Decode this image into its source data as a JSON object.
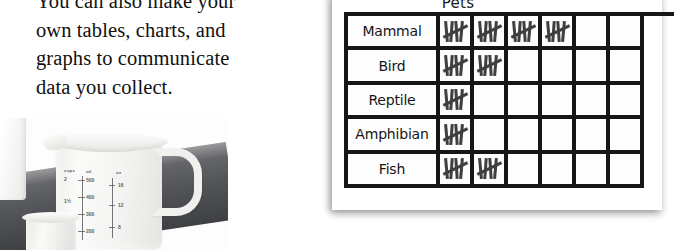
{
  "body_text": {
    "lines": [
      "You can also make your",
      "own tables, charts, and",
      "graphs to communicate",
      "data you collect."
    ]
  },
  "chart_card": {
    "title": "Pets"
  },
  "chart_data": {
    "type": "table",
    "title": "Pets",
    "xlabel": "",
    "ylabel": "",
    "categories": [
      "Mammal",
      "Bird",
      "Reptile",
      "Amphibian",
      "Fish"
    ],
    "values": [
      4,
      2,
      1,
      1,
      2
    ],
    "columns_visible": 6,
    "mark_symbol": "tally-mark",
    "mark_value": 5,
    "grid": true,
    "rows": [
      {
        "label": "Mammal",
        "count": 4,
        "cells": [
          true,
          true,
          true,
          true,
          false,
          false
        ]
      },
      {
        "label": "Bird",
        "count": 2,
        "cells": [
          true,
          true,
          false,
          false,
          false,
          false
        ]
      },
      {
        "label": "Reptile",
        "count": 1,
        "cells": [
          true,
          false,
          false,
          false,
          false,
          false
        ]
      },
      {
        "label": "Amphibian",
        "count": 1,
        "cells": [
          true,
          false,
          false,
          false,
          false,
          false
        ]
      },
      {
        "label": "Fish",
        "count": 2,
        "cells": [
          true,
          true,
          false,
          false,
          false,
          false
        ]
      }
    ]
  },
  "photo": {
    "scale_headers": [
      "cups",
      "ml",
      "oz"
    ],
    "ml_values": [
      "500",
      "400",
      "300",
      "200"
    ],
    "oz_values": [
      "16",
      "12",
      "8"
    ],
    "cup_values": [
      "2",
      "1½",
      "1"
    ]
  },
  "colors": {
    "ink": "#161616",
    "tally": "#3f3f3f",
    "page": "#ffffff",
    "counter": "#54565a"
  }
}
